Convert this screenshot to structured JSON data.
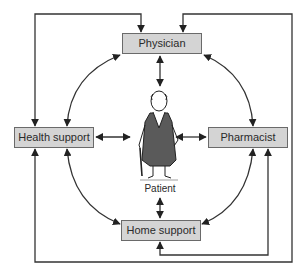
{
  "diagram": {
    "nodes": [
      {
        "id": "physician",
        "label": "Physician"
      },
      {
        "id": "health_support",
        "label": "Health support"
      },
      {
        "id": "pharmacist",
        "label": "Pharmacist"
      },
      {
        "id": "home_support",
        "label": "Home support"
      }
    ],
    "center": {
      "label": "Patient",
      "icon": "elderly-man-with-cane-icon"
    },
    "edges": [
      {
        "from": "patient",
        "to": "physician",
        "type": "bidirectional-straight"
      },
      {
        "from": "patient",
        "to": "health_support",
        "type": "bidirectional-straight"
      },
      {
        "from": "patient",
        "to": "pharmacist",
        "type": "bidirectional-straight"
      },
      {
        "from": "patient",
        "to": "home_support",
        "type": "bidirectional-straight"
      },
      {
        "from": "physician",
        "to": "health_support",
        "type": "bidirectional-arc"
      },
      {
        "from": "physician",
        "to": "pharmacist",
        "type": "bidirectional-arc"
      },
      {
        "from": "health_support",
        "to": "home_support",
        "type": "bidirectional-arc"
      },
      {
        "from": "pharmacist",
        "to": "home_support",
        "type": "bidirectional-arc"
      },
      {
        "from": "physician",
        "to": "health_support",
        "type": "outer-loop-left"
      },
      {
        "from": "health_support",
        "to": "physician",
        "type": "outer-loop-right"
      },
      {
        "from": "home_support",
        "to": "pharmacist",
        "type": "outer-loop-bottom"
      }
    ],
    "colors": {
      "box_fill": "#d4d4d4",
      "box_border": "#6a6a6a",
      "line": "#333333",
      "text": "#2a2a2a"
    }
  }
}
